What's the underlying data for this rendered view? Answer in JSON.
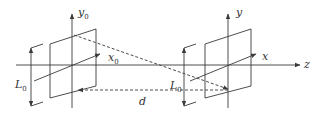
{
  "diagram": {
    "type": "two coordinate systems with planes along z-axis",
    "colors": {
      "line": "#3a3a3a",
      "background": "#ffffff"
    },
    "labels": {
      "y0": {
        "base": "y",
        "sub": "0"
      },
      "x0": {
        "base": "x",
        "sub": "0"
      },
      "L0_left": {
        "base": "L",
        "sub": "0"
      },
      "y": "y",
      "x": "x",
      "z": "z",
      "d": "d",
      "L0_right": {
        "base": "L",
        "sub": "0"
      }
    }
  }
}
